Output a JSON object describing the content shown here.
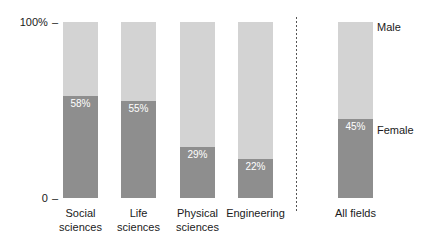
{
  "chart_data": {
    "type": "bar",
    "subtype": "stacked-100-percent",
    "title": "",
    "subtitle": "",
    "xlabel": "",
    "ylabel": "",
    "ylim": [
      0,
      100
    ],
    "ytick_labels": [
      "100%",
      "0"
    ],
    "grid": false,
    "legend_position": "right",
    "legend": [
      "Male",
      "Female"
    ],
    "colors": {
      "male": "#d3d3d3",
      "female": "#8e8e8e",
      "value_text": "#ffffff",
      "axis_text": "#1a1a1a",
      "divider": "#555555",
      "background": "#ffffff"
    },
    "categories": [
      "Social sciences",
      "Life sciences",
      "Physical sciences",
      "Engineering",
      "All fields"
    ],
    "series": [
      {
        "name": "Female",
        "values": [
          58,
          55,
          29,
          22,
          45
        ]
      },
      {
        "name": "Male",
        "values": [
          42,
          45,
          71,
          78,
          55
        ]
      }
    ],
    "annotations": [
      "Dotted vertical divider separates individual fields from the All fields summary bar"
    ]
  },
  "axis": {
    "top_label": "100%",
    "bottom_label": "0",
    "tick_dash": "–"
  },
  "legend": {
    "male": "Male",
    "female": "Female"
  },
  "bars": [
    {
      "id": "social-sciences",
      "label_line1": "Social",
      "label_line2": "sciences",
      "female_pct": 58,
      "male_pct": 42,
      "value_text": "58%"
    },
    {
      "id": "life-sciences",
      "label_line1": "Life",
      "label_line2": "sciences",
      "female_pct": 55,
      "male_pct": 45,
      "value_text": "55%"
    },
    {
      "id": "physical-sciences",
      "label_line1": "Physical",
      "label_line2": "sciences",
      "female_pct": 29,
      "male_pct": 71,
      "value_text": "29%"
    },
    {
      "id": "engineering",
      "label_line1": "Engineering",
      "label_line2": "",
      "female_pct": 22,
      "male_pct": 78,
      "value_text": "22%"
    },
    {
      "id": "all-fields",
      "label_line1": "All fields",
      "label_line2": "",
      "female_pct": 45,
      "male_pct": 55,
      "value_text": "45%"
    }
  ]
}
